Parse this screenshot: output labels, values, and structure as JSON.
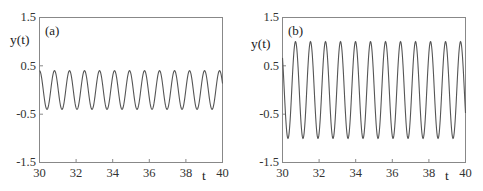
{
  "chart_data": [
    {
      "type": "line",
      "panel_label": "(a)",
      "title": "",
      "xlabel": "t",
      "ylabel": "y(t)",
      "xlim": [
        30,
        40
      ],
      "ylim": [
        -1.5,
        1.5
      ],
      "x_ticks": [
        "30",
        "32",
        "34",
        "36",
        "38",
        "40"
      ],
      "y_ticks": [
        "1.5",
        "0.5",
        "-0.5",
        "-1.5"
      ],
      "grid": false,
      "series": [
        {
          "name": "y(t)",
          "description": "sinusoidal oscillation",
          "amplitude": 0.4,
          "period": 0.82,
          "phase_start": "peak at t=30",
          "x": [
            30.0,
            30.41,
            30.82,
            31.23,
            31.64,
            32.05,
            32.46,
            32.87,
            33.28,
            33.69,
            34.1,
            34.51,
            34.92,
            35.33,
            35.74,
            36.15,
            36.56,
            36.97,
            37.38,
            37.79,
            38.2,
            38.61,
            39.02,
            39.43,
            39.84
          ],
          "values": [
            0.4,
            -0.4,
            0.4,
            -0.4,
            0.4,
            -0.4,
            0.4,
            -0.4,
            0.4,
            -0.4,
            0.4,
            -0.4,
            0.4,
            -0.4,
            0.4,
            -0.4,
            0.4,
            -0.4,
            0.4,
            -0.4,
            0.4,
            -0.4,
            0.4,
            -0.4,
            0.4
          ]
        }
      ]
    },
    {
      "type": "line",
      "panel_label": "(b)",
      "title": "",
      "xlabel": "t",
      "ylabel": "y(t)",
      "xlim": [
        30,
        40
      ],
      "ylim": [
        -1.5,
        1.5
      ],
      "x_ticks": [
        "30",
        "32",
        "34",
        "36",
        "38",
        "40"
      ],
      "y_ticks": [
        "1.5",
        "0.5",
        "-0.5",
        "-1.5"
      ],
      "grid": false,
      "series": [
        {
          "name": "y(t)",
          "description": "sinusoidal oscillation",
          "amplitude": 1.0,
          "period": 0.82,
          "phase_start": "near 0 at t=30, descending; first trough t≈30.3",
          "x": [
            30.0,
            30.3,
            30.71,
            31.12,
            31.53,
            31.94,
            32.35,
            32.76,
            33.17,
            33.58,
            33.99,
            34.4,
            34.81,
            35.22,
            35.63,
            36.04,
            36.45,
            36.86,
            37.27,
            37.68,
            38.09,
            38.5,
            38.91,
            39.32,
            39.73,
            40.0
          ],
          "values": [
            0.3,
            -1.0,
            1.0,
            -1.0,
            1.0,
            -1.0,
            1.0,
            -1.0,
            1.0,
            -1.0,
            1.0,
            -1.0,
            1.0,
            -1.0,
            1.0,
            -1.0,
            1.0,
            -1.0,
            1.0,
            -1.0,
            1.0,
            -1.0,
            1.0,
            -1.0,
            1.0,
            0.0
          ]
        }
      ]
    }
  ],
  "panels": [
    {
      "label": "(a)",
      "ylabel": "y(t)",
      "xlabel": "t",
      "y_ticks": [
        "1.5",
        "0.5",
        "-0.5",
        "-1.5"
      ],
      "x_ticks": [
        "30",
        "32",
        "34",
        "36",
        "38",
        "40"
      ]
    },
    {
      "label": "(b)",
      "ylabel": "y(t)",
      "xlabel": "t",
      "y_ticks": [
        "1.5",
        "0.5",
        "-0.5",
        "-1.5"
      ],
      "x_ticks": [
        "30",
        "32",
        "34",
        "36",
        "38",
        "40"
      ]
    }
  ],
  "colors": {
    "curve": "#555555",
    "frame": "#888888",
    "text": "#222222"
  }
}
